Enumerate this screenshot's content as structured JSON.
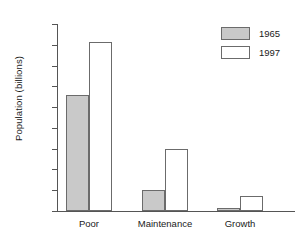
{
  "chart_data": {
    "type": "bar",
    "title": "",
    "xlabel": "",
    "ylabel": "Population (billions)",
    "categories": [
      "Poor",
      "Maintenance",
      "Growth"
    ],
    "series": [
      {
        "name": "1965",
        "values": [
          2.8,
          0.5,
          0.08
        ],
        "color": "#c9c9c9"
      },
      {
        "name": "1997",
        "values": [
          4.07,
          1.5,
          0.35
        ],
        "color": "#ffffff"
      }
    ],
    "ylim": [
      0,
      4.5
    ],
    "ytick_labels": [
      "0",
      "0.5",
      "1.0",
      "1.5",
      "2.0",
      "2.5",
      "3.0",
      "3.5",
      "4.0",
      "4.5"
    ],
    "ytick_values": [
      0,
      0.5,
      1.0,
      1.5,
      2.0,
      2.5,
      3.0,
      3.5,
      4.0,
      4.5
    ],
    "grid": false,
    "legend_position": "top-right",
    "bar_edge_color": "#6b6b6b",
    "axis_color": "#555555"
  }
}
